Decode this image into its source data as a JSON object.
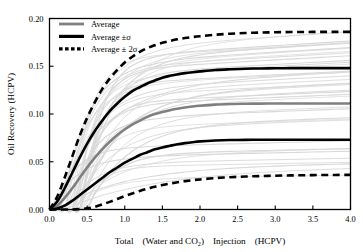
{
  "chart_data": {
    "type": "line",
    "title": "",
    "subtitle": "",
    "xlabel_parts": {
      "pre": "Total　(Water and CO",
      "sub": "2",
      "post": ")　Injection　(HCPV)"
    },
    "xlabel": "Total (Water and CO2) Injection (HCPV)",
    "ylabel": "Oil Recovery  (HCPV)",
    "xlim": [
      0.0,
      4.0
    ],
    "ylim": [
      0.0,
      0.2
    ],
    "grid": false,
    "legend_position": "top-left",
    "xticks": [
      0.0,
      0.5,
      1.0,
      1.5,
      2.0,
      2.5,
      3.0,
      3.5,
      4.0
    ],
    "xticklabels": [
      "0.0",
      "0.5",
      "1.0",
      "1.5",
      "2.0",
      "2.5",
      "3.0",
      "3.5",
      "4.0"
    ],
    "yticks": [
      0.0,
      0.05,
      0.1,
      0.15,
      0.2
    ],
    "yticklabels": [
      "0.00",
      "0.05",
      "0.10",
      "0.15",
      "0.20"
    ],
    "x": [
      0.0,
      0.1,
      0.2,
      0.3,
      0.4,
      0.5,
      0.6,
      0.7,
      0.8,
      0.9,
      1.0,
      1.1,
      1.2,
      1.3,
      1.4,
      1.5,
      1.6,
      1.7,
      1.8,
      1.9,
      2.0,
      2.2,
      2.4,
      2.6,
      2.8,
      3.0,
      3.2,
      3.4,
      3.6,
      3.8,
      4.0
    ],
    "series": [
      {
        "name": "Average",
        "color": "#808080",
        "style": "solid",
        "width": 2.6,
        "plateau": 0.111,
        "values": [
          0.0,
          0.004,
          0.012,
          0.022,
          0.033,
          0.044,
          0.054,
          0.063,
          0.071,
          0.078,
          0.084,
          0.089,
          0.093,
          0.097,
          0.1,
          0.102,
          0.104,
          0.1055,
          0.1068,
          0.1078,
          0.1086,
          0.1098,
          0.1104,
          0.1107,
          0.1109,
          0.111,
          0.111,
          0.111,
          0.111,
          0.111,
          0.111
        ]
      },
      {
        "name": "Average +σ",
        "color": "#000000",
        "style": "solid",
        "width": 2.6,
        "plateau": 0.148,
        "values": [
          0.0,
          0.008,
          0.022,
          0.038,
          0.054,
          0.069,
          0.082,
          0.093,
          0.103,
          0.111,
          0.118,
          0.124,
          0.128,
          0.132,
          0.135,
          0.138,
          0.14,
          0.1415,
          0.1428,
          0.1438,
          0.1446,
          0.146,
          0.1468,
          0.1474,
          0.1477,
          0.1479,
          0.148,
          0.148,
          0.148,
          0.148,
          0.148
        ]
      },
      {
        "name": "Average −σ",
        "color": "#000000",
        "style": "solid",
        "width": 2.6,
        "plateau": 0.073,
        "values": [
          0.0,
          0.001,
          0.004,
          0.009,
          0.015,
          0.021,
          0.027,
          0.033,
          0.039,
          0.044,
          0.049,
          0.053,
          0.057,
          0.06,
          0.063,
          0.065,
          0.0667,
          0.0683,
          0.0695,
          0.0705,
          0.0713,
          0.0722,
          0.0727,
          0.0729,
          0.073,
          0.073,
          0.073,
          0.073,
          0.073,
          0.073,
          0.073
        ]
      },
      {
        "name": "Average + 2σ",
        "color": "#000000",
        "style": "dashed",
        "width": 2.6,
        "plateau": 0.186,
        "values": [
          0.0,
          0.013,
          0.033,
          0.055,
          0.077,
          0.096,
          0.112,
          0.126,
          0.137,
          0.146,
          0.154,
          0.16,
          0.165,
          0.169,
          0.172,
          0.1745,
          0.1765,
          0.1782,
          0.1795,
          0.1806,
          0.1815,
          0.183,
          0.1841,
          0.1848,
          0.1853,
          0.1856,
          0.1858,
          0.1859,
          0.186,
          0.186,
          0.186
        ]
      },
      {
        "name": "Average − 2σ",
        "color": "#000000",
        "style": "dashed",
        "width": 2.6,
        "plateau": 0.037,
        "values": [
          0.0,
          0.0,
          0.0,
          0.0,
          0.0005,
          0.0012,
          0.0028,
          0.0052,
          0.008,
          0.011,
          0.014,
          0.0168,
          0.0194,
          0.0217,
          0.0238,
          0.0256,
          0.0272,
          0.0286,
          0.0297,
          0.0307,
          0.0315,
          0.0329,
          0.0338,
          0.0345,
          0.035,
          0.0354,
          0.0357,
          0.0359,
          0.0361,
          0.0362,
          0.0363
        ]
      }
    ],
    "background_realizations": {
      "count": 40,
      "color": "#d9d9d9",
      "description": "individual realization oil recovery curves"
    },
    "legend": [
      {
        "label": "Average",
        "swatch": "solid-gray",
        "color": "#808080"
      },
      {
        "label": "Average ±σ",
        "swatch": "solid-black",
        "color": "#000000"
      },
      {
        "label": "Average ± 2σ",
        "swatch": "dashed-black",
        "color": "#000000"
      }
    ]
  }
}
